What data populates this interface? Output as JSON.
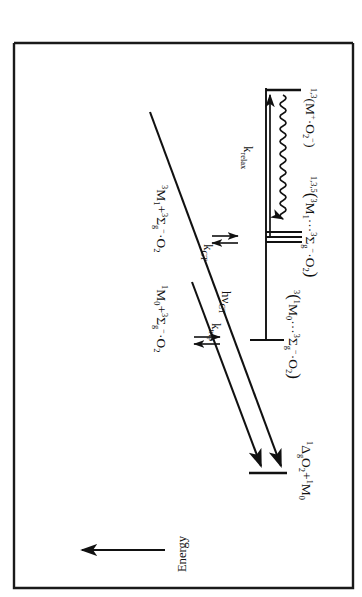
{
  "figure": {
    "type": "energy-level-diagram",
    "orientation_note": "figure printed rotated 90 degrees",
    "axis": {
      "label": "Energy",
      "direction": "arrow pointing toward higher energy"
    },
    "column_labels": [
      "Separated Molecules",
      "Complex States",
      "Separated Molecules"
    ],
    "levels": {
      "ct_ion_pair": {
        "label": "1,3(M+·O2−)",
        "label_parts": {
          "presuperscript": "1,3",
          "body": "(M",
          "charge_plus": "+",
          "mid": "·O",
          "sub": "2",
          "charge_minus": "−",
          "close": ")"
        }
      },
      "exciplex_triplet": {
        "label": "1,3,5(3M1···3Σg−·O2)",
        "label_parts": {
          "presuperscript": "1,3,5",
          "open": "(",
          "sup1": "3",
          "m1": "M",
          "m1sub": "1",
          "dots": "···",
          "sup2": "3",
          "sigma": "Σ",
          "gsub": "g",
          "minus": "−",
          "dot": "·O",
          "o2sub": "2",
          "close": ")"
        }
      },
      "ground_complex": {
        "label": "3(1M0···3Σg−·O2)",
        "label_parts": {
          "presuperscript": "3",
          "open": "(",
          "sup1": "1",
          "m0": "M",
          "m0sub": "0",
          "dots": "···",
          "sup2": "3",
          "sigma": "Σ",
          "gsub": "g",
          "minus": "−",
          "dot": "·O",
          "o2sub": "2",
          "close": ")"
        }
      },
      "singlet_oxygen_products": {
        "label": "1ΔgO2 + 1M0",
        "label_parts": {
          "sup1": "1",
          "delta": "Δ",
          "gsub": "g",
          "o": "O",
          "osub": "2",
          "plus": "+",
          "sup2": "1",
          "m": "M",
          "msub": "0"
        }
      },
      "separated_triplet": {
        "label": "3M1 + 3Σg−·O2",
        "label_parts": {
          "sup1": "3",
          "m": "M",
          "msub": "1",
          "plus": "+",
          "sup2": "3",
          "sigma": "Σ",
          "gsub": "g",
          "minus": "−",
          "dot": "·O",
          "o2sub": "2"
        }
      },
      "separated_ground": {
        "label": "1M0 + 3Σg−·O2",
        "label_parts": {
          "sup1": "1",
          "m": "M",
          "msub": "0",
          "plus": "+",
          "sup2": "3",
          "sigma": "Σ",
          "gsub": "g",
          "minus": "−",
          "dot": "·O",
          "o2sub": "2"
        }
      }
    },
    "processes": {
      "k_ct": {
        "base": "k",
        "sub": "CT"
      },
      "k_trip": {
        "base": "k",
        "sub": "trip"
      },
      "k_relax": {
        "base": "k",
        "sub": "relax"
      },
      "hv_ct": {
        "base": "hν",
        "sub": "CT"
      }
    },
    "colors": {
      "ink": "#111111",
      "background": "#ffffff",
      "frame": "#1a1a1a"
    }
  }
}
